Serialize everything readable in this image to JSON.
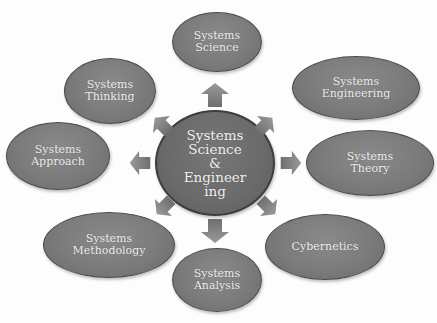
{
  "diagram": {
    "type": "radial-concept-map",
    "center": {
      "label": "Systems\nScience\n&\nEngineer\ning"
    },
    "nodes": [
      {
        "id": "systems-science",
        "label": "Systems\nScience"
      },
      {
        "id": "systems-engineering",
        "label": "Systems\nEngineering"
      },
      {
        "id": "systems-theory",
        "label": "Systems\nTheory"
      },
      {
        "id": "cybernetics",
        "label": "Cybernetics"
      },
      {
        "id": "systems-analysis",
        "label": "Systems\nAnalysis"
      },
      {
        "id": "systems-methodology",
        "label": "Systems\nMethodology"
      },
      {
        "id": "systems-approach",
        "label": "Systems\nApproach"
      },
      {
        "id": "systems-thinking",
        "label": "Systems\nThinking"
      }
    ],
    "arrows": [
      {
        "from": "center",
        "to": "systems-science",
        "direction": "up"
      },
      {
        "from": "center",
        "to": "systems-engineering",
        "direction": "up-right"
      },
      {
        "from": "center",
        "to": "systems-theory",
        "direction": "right"
      },
      {
        "from": "center",
        "to": "cybernetics",
        "direction": "down-right"
      },
      {
        "from": "center",
        "to": "systems-analysis",
        "direction": "down"
      },
      {
        "from": "center",
        "to": "systems-methodology",
        "direction": "down-left"
      },
      {
        "from": "center",
        "to": "systems-approach",
        "direction": "left"
      },
      {
        "from": "center",
        "to": "systems-thinking",
        "direction": "up-left"
      }
    ],
    "colors": {
      "node_fill": "#7b7b7b",
      "node_border": "#4a4a4a",
      "center_fill": "#6a6a6a",
      "text": "#f0f0f0",
      "arrow": "#808080",
      "background": "#ffffff"
    }
  }
}
